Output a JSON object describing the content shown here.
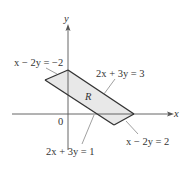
{
  "figure": {
    "axes": {
      "x_label": "x",
      "y_label": "y",
      "origin_label": "0"
    },
    "region": {
      "label": "R",
      "fill_color": "#e8e8e8",
      "edge_color": "#333333"
    },
    "boundary_labels": {
      "top_left": "x − 2y = −2",
      "top_right": "2x + 3y = 3",
      "bottom_left": "2x + 3y = 1",
      "bottom_right": "x − 2y = 2"
    },
    "vertices": [
      {
        "name": "top",
        "point": [
          0,
          1
        ]
      },
      {
        "name": "left",
        "point": [
          -0.4,
          0.6
        ]
      },
      {
        "name": "bottom",
        "point": [
          1.14,
          -0.43
        ]
      },
      {
        "name": "right",
        "point": [
          1.5,
          0
        ]
      }
    ]
  }
}
